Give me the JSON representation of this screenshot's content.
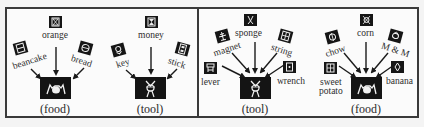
{
  "panels": [
    {
      "id": "left",
      "groups": [
        {
          "category": "(food)",
          "items": [
            {
              "label": "orange",
              "icon": "orange-symbol"
            },
            {
              "label": "beancake",
              "icon": "beancake-symbol"
            },
            {
              "label": "bread",
              "icon": "bread-symbol"
            }
          ]
        },
        {
          "category": "(tool)",
          "items": [
            {
              "label": "money",
              "icon": "money-symbol"
            },
            {
              "label": "key",
              "icon": "key-symbol"
            },
            {
              "label": "stick",
              "icon": "stick-symbol"
            }
          ]
        }
      ]
    },
    {
      "id": "right",
      "groups": [
        {
          "category": "(tool)",
          "items": [
            {
              "label": "sponge",
              "icon": "sponge-symbol"
            },
            {
              "label": "magnet",
              "icon": "magnet-symbol"
            },
            {
              "label": "string",
              "icon": "string-symbol"
            },
            {
              "label": "lever",
              "icon": "lever-symbol"
            },
            {
              "label": "wrench",
              "icon": "wrench-symbol"
            }
          ]
        },
        {
          "category": "(food)",
          "items": [
            {
              "label": "corn",
              "icon": "corn-symbol"
            },
            {
              "label": "chow",
              "icon": "chow-symbol"
            },
            {
              "label": "M & M",
              "icon": "m-and-m-symbol"
            },
            {
              "label": "sweet",
              "label2": "potato",
              "icon": "sweet-potato-symbol"
            },
            {
              "label": "banana",
              "icon": "banana-symbol"
            }
          ]
        }
      ]
    }
  ],
  "colors": {
    "background": "#fbfbfb",
    "border": "#3a3a3a",
    "symbol": "#161616",
    "glyph": "#f2f2f2",
    "text": "#2d2d2d"
  }
}
